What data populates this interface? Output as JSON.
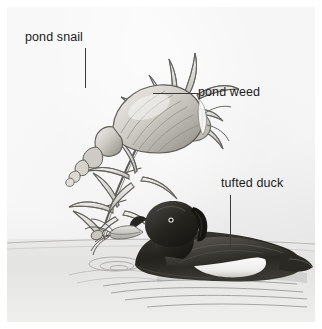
{
  "figure": {
    "style": "pencil / engraving line drawing, greyscale",
    "panel_color": "#efefef",
    "page_color": "#ffffff",
    "ink_color": "#3a3a3a",
    "text_color": "#1b1b1b"
  },
  "labels": [
    {
      "id": "pond-snail",
      "text": "pond snail",
      "leader": "vertical line down to the snail shell"
    },
    {
      "id": "pond-weed",
      "text": "pond weed",
      "leader": "horizontal line left to the weed leaves"
    },
    {
      "id": "tufted-duck",
      "text": "tufted duck",
      "leader": "vertical line down to the duck's back"
    }
  ],
  "subjects": [
    {
      "name": "pond snail",
      "description": "Spiral conical shell gripping the pond weed stem, body and foot wrapped around the stalk",
      "location": "upper left"
    },
    {
      "name": "pond weed",
      "description": "Diagonal stem with whorls of narrow curved leaves rising from lower left to upper right",
      "location": "left side"
    },
    {
      "name": "tufted duck",
      "description": "Duck swimming on the water, dark head with drooping crest, pale grey bill holding a morsel, dark back and white flank patch, ripples and reflection on the water",
      "location": "lower right"
    }
  ],
  "scene": {
    "water_line": "horizontal water surface across the lower third",
    "ripples": "concentric rings to the left of the duck"
  }
}
